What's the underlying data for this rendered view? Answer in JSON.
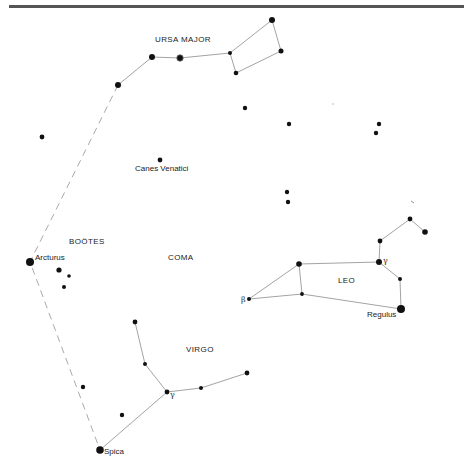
{
  "colors": {
    "background": "#ffffff",
    "star": "#111111",
    "line": "#999999",
    "dashed": "#aaaaaa",
    "border": "#555555"
  },
  "constellations": {
    "ursa_major": {
      "label": "URSA MAJOR"
    },
    "canes_venatici": {
      "label": "Canes Venatici"
    },
    "bootes": {
      "label": "BOÖTES"
    },
    "coma": {
      "label": "COMA"
    },
    "leo": {
      "label": "LEO"
    },
    "virgo": {
      "label": "VIRGO"
    }
  },
  "stars": {
    "arcturus": {
      "label": "Arcturus"
    },
    "regulus": {
      "label": "Regulus"
    },
    "spica": {
      "label": "Spica"
    },
    "leo_beta": {
      "label": "β"
    },
    "leo_gamma": {
      "label": "γ"
    },
    "virgo_gamma": {
      "label": "γ"
    }
  }
}
